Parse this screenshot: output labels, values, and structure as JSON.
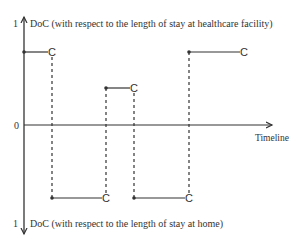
{
  "diagram": {
    "top_axis_label": "DoC (with respect to the length of stay at healthcare facility)",
    "bottom_axis_label": "DoC (with respect to the length of stay at home)",
    "top_tick": "1",
    "zero_tick": "0",
    "bottom_tick": "1",
    "x_axis_label": "Timeline",
    "marker_label": "C",
    "colors": {
      "line": "#333333",
      "background": "#ffffff"
    },
    "steps": [
      {
        "side": "facility",
        "x_start": 24,
        "x_end": 52,
        "y": 52
      },
      {
        "side": "home",
        "x_start": 52,
        "x_end": 106,
        "y": 198
      },
      {
        "side": "facility",
        "x_start": 106,
        "x_end": 134,
        "y": 88
      },
      {
        "side": "home",
        "x_start": 134,
        "x_end": 189,
        "y": 198
      },
      {
        "side": "facility",
        "x_start": 189,
        "x_end": 244,
        "y": 52
      }
    ]
  }
}
